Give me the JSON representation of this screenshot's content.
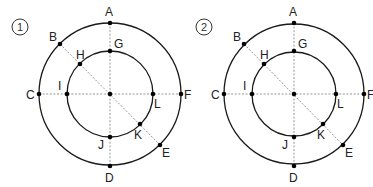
{
  "diagrams": [
    {
      "id": "diagram-1",
      "number_label": "1",
      "center": [
        110,
        94
      ],
      "outer_radius": 71,
      "inner_radius": 43,
      "points": [
        {
          "name": "A",
          "x": 110,
          "y": 23,
          "lx": 105,
          "ly": 16
        },
        {
          "name": "B",
          "x": 60,
          "y": 44,
          "lx": 49,
          "ly": 41
        },
        {
          "name": "C",
          "x": 39,
          "y": 94,
          "lx": 26,
          "ly": 99
        },
        {
          "name": "D",
          "x": 110,
          "y": 166,
          "lx": 105,
          "ly": 182
        },
        {
          "name": "E",
          "x": 160,
          "y": 145,
          "lx": 162,
          "ly": 157
        },
        {
          "name": "F",
          "x": 181,
          "y": 94,
          "lx": 184,
          "ly": 99
        },
        {
          "name": "G",
          "x": 110,
          "y": 51,
          "lx": 114,
          "ly": 48
        },
        {
          "name": "H",
          "x": 80,
          "y": 64,
          "lx": 76,
          "ly": 59
        },
        {
          "name": "I",
          "x": 67,
          "y": 94,
          "lx": 58,
          "ly": 90
        },
        {
          "name": "J",
          "x": 110,
          "y": 137,
          "lx": 98,
          "ly": 149
        },
        {
          "name": "K",
          "x": 140,
          "y": 124,
          "lx": 134,
          "ly": 139
        },
        {
          "name": "L",
          "x": 153,
          "y": 94,
          "lx": 154,
          "ly": 108
        }
      ]
    },
    {
      "id": "diagram-2",
      "number_label": "2",
      "center": [
        294,
        94
      ],
      "outer_radius": 70,
      "inner_radius": 42,
      "points": [
        {
          "name": "A",
          "x": 294,
          "y": 23,
          "lx": 289,
          "ly": 16
        },
        {
          "name": "B",
          "x": 244,
          "y": 44,
          "lx": 233,
          "ly": 41
        },
        {
          "name": "C",
          "x": 224,
          "y": 94,
          "lx": 211,
          "ly": 99
        },
        {
          "name": "D",
          "x": 294,
          "y": 166,
          "lx": 289,
          "ly": 182
        },
        {
          "name": "E",
          "x": 343,
          "y": 145,
          "lx": 345,
          "ly": 157
        },
        {
          "name": "F",
          "x": 364,
          "y": 94,
          "lx": 367,
          "ly": 99
        },
        {
          "name": "G",
          "x": 294,
          "y": 51,
          "lx": 298,
          "ly": 48
        },
        {
          "name": "H",
          "x": 264,
          "y": 64,
          "lx": 260,
          "ly": 59
        },
        {
          "name": "I",
          "x": 252,
          "y": 94,
          "lx": 243,
          "ly": 90
        },
        {
          "name": "J",
          "x": 294,
          "y": 137,
          "lx": 282,
          "ly": 149
        },
        {
          "name": "K",
          "x": 323,
          "y": 124,
          "lx": 317,
          "ly": 139
        },
        {
          "name": "L",
          "x": 336,
          "y": 94,
          "lx": 337,
          "ly": 108
        }
      ]
    }
  ]
}
